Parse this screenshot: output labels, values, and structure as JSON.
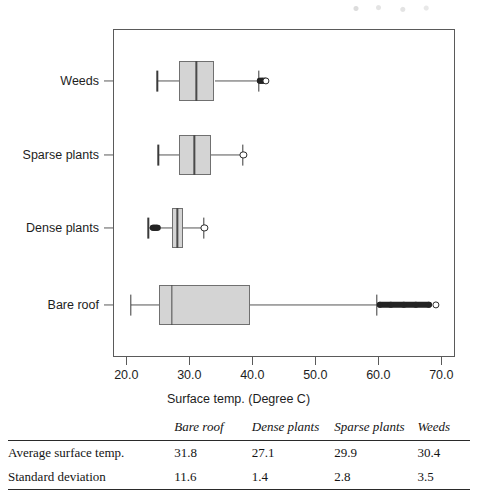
{
  "chart_data": {
    "type": "box",
    "title": "",
    "xlabel": "Surface temp. (Degree C)",
    "ylabel": "",
    "xlim": [
      16.8,
      72.2
    ],
    "xticks": [
      "20.0",
      "30.0",
      "40.0",
      "50.0",
      "60.0",
      "70.0"
    ],
    "xtick_values": [
      20.0,
      30.0,
      40.0,
      50.0,
      60.0,
      70.0
    ],
    "grid": false,
    "legend": "none",
    "categories": [
      "Bare roof",
      "Dense plants",
      "Sparse plants",
      "Weeds"
    ],
    "boxes": [
      {
        "category": "Weeds",
        "whisker_low": 24.9,
        "q1": 28.4,
        "median": 31.1,
        "q3": 34.0,
        "whisker_high": 41.0,
        "outliers_high": [
          41.2,
          41.6,
          42.0,
          42.2
        ],
        "outliers_low": []
      },
      {
        "category": "Sparse plants",
        "whisker_low": 25.1,
        "q1": 28.4,
        "median": 30.8,
        "q3": 33.5,
        "whisker_high": 38.5,
        "outliers_high": [
          38.6
        ],
        "outliers_low": []
      },
      {
        "category": "Dense plants",
        "whisker_low": 23.5,
        "q1": 27.2,
        "median": 28.1,
        "q3": 29.0,
        "whisker_high": 32.3,
        "outliers_high": [
          32.4
        ],
        "outliers_low": [
          24.3,
          24.6,
          24.9
        ]
      },
      {
        "category": "Bare roof",
        "whisker_low": 20.7,
        "q1": 25.2,
        "median": 27.2,
        "q3": 39.7,
        "whisker_high": 59.8,
        "outliers_high": [
          60.2,
          62.0,
          64.0,
          66.0,
          68.0,
          69.2
        ],
        "outliers_low": []
      }
    ]
  },
  "table": {
    "headers": [
      "",
      "Bare roof",
      "Dense plants",
      "Sparse plants",
      "Weeds"
    ],
    "rows": [
      {
        "label": "Average surface temp.",
        "values": [
          "31.8",
          "27.1",
          "29.9",
          "30.4"
        ]
      },
      {
        "label": "Standard deviation",
        "values": [
          "11.6",
          "1.4",
          "2.8",
          "3.5"
        ]
      }
    ]
  },
  "colors": {
    "box_fill": "#d4d4d4",
    "box_stroke": "#707070",
    "axis": "#5a5a5a",
    "outlier": "#232323",
    "text": "#1a1a1a"
  }
}
